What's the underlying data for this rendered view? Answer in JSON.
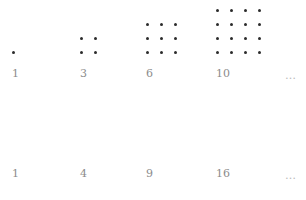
{
  "figure": {
    "width": 306,
    "height": 200,
    "background": "#ffffff",
    "dot_color": "#2b2b2b",
    "label_color": "#8c8c8c",
    "ellipsis_color": "#b9b9b9",
    "dot_size": 3,
    "cell_spacing": 14
  },
  "chart_data": {
    "type": "scatter",
    "title": "",
    "xlabel": "",
    "ylabel": "",
    "grid": false,
    "legend": null,
    "rows": [
      {
        "name": "triangular-numbers",
        "categories": [
          "1",
          "3",
          "6",
          "10"
        ],
        "values": [
          1,
          3,
          6,
          10
        ],
        "trailing": "…",
        "shape": "staircase-triangle",
        "column_heights": [
          [
            1
          ],
          [
            2,
            1
          ],
          [
            3,
            2,
            1
          ],
          [
            4,
            3,
            2,
            1
          ]
        ]
      },
      {
        "name": "square-numbers",
        "categories": [
          "1",
          "4",
          "9",
          "16"
        ],
        "values": [
          1,
          4,
          9,
          16
        ],
        "trailing": "…",
        "shape": "square-grid",
        "grid_sizes": [
          1,
          2,
          3,
          4
        ]
      }
    ]
  },
  "rows": [
    {
      "row_top": 0,
      "label_top": 68,
      "dots_bottom": 54,
      "groups": [
        {
          "label": "1",
          "left": 12,
          "columns": [
            1
          ]
        },
        {
          "label": "3",
          "left": 80,
          "columns": [
            2,
            1
          ]
        },
        {
          "label": "6",
          "left": 146,
          "columns": [
            3,
            2,
            1
          ]
        },
        {
          "label": "10",
          "left": 216,
          "columns": [
            4,
            3,
            2,
            1
          ]
        }
      ],
      "ellipsis": {
        "text": "…",
        "left": 285,
        "top": 70
      }
    },
    {
      "row_top": 100,
      "label_top": 68,
      "dots_bottom": 54,
      "groups": [
        {
          "label": "1",
          "left": 12,
          "columns": [
            1
          ]
        },
        {
          "label": "4",
          "left": 80,
          "columns": [
            2,
            2
          ]
        },
        {
          "label": "9",
          "left": 146,
          "columns": [
            3,
            3,
            3
          ]
        },
        {
          "label": "16",
          "left": 216,
          "columns": [
            4,
            4,
            4,
            4
          ]
        }
      ],
      "ellipsis": {
        "text": "…",
        "left": 285,
        "top": 70
      }
    }
  ]
}
